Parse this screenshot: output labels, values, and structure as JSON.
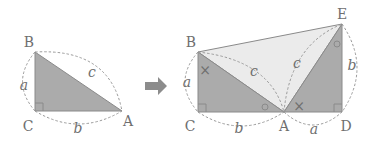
{
  "colors": {
    "dark_fill": "#ababab",
    "light_fill": "#ebebeb",
    "stroke": "#8a8a8a",
    "arrow": "#8c8c8c",
    "text": "#6f6f6f"
  },
  "left_triangle": {
    "vertices": {
      "B": "B",
      "C": "C",
      "A": "A"
    },
    "sides": {
      "a": "a",
      "b": "b",
      "c": "c"
    }
  },
  "arrow": {
    "icon": "right-arrow-icon"
  },
  "right_figure": {
    "vertices": {
      "B": "B",
      "C": "C",
      "A": "A",
      "D": "D",
      "E": "E"
    },
    "sides": {
      "BC": "a",
      "CA": "b",
      "BA": "c",
      "AE": "c",
      "ED": "b",
      "AD": "a"
    },
    "angle_marks": {
      "cross": "×",
      "circle": "○"
    }
  }
}
